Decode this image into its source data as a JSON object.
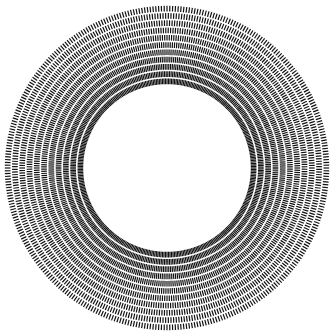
{
  "image": {
    "description": "Annular radial grating pattern (concentric ring with dense radial black/white stripes)",
    "center": [
      167,
      168
    ],
    "outer_radius": 163,
    "inner_radius": 83,
    "spoke_count": 360,
    "ring_count": 11,
    "colors": {
      "background": "#ffffff",
      "stripe": "#111111"
    }
  }
}
